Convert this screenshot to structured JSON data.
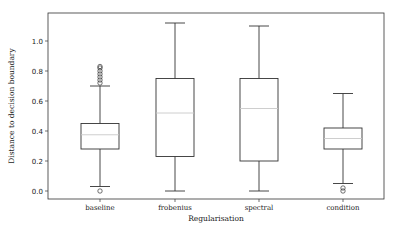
{
  "chart_data": {
    "type": "box",
    "title": "",
    "xlabel": "Regularisation",
    "ylabel": "Distance to decision boundary",
    "ylim": [
      -0.03,
      1.19
    ],
    "yticks": [
      0.0,
      0.2,
      0.4,
      0.6,
      0.8,
      1.0
    ],
    "ytick_labels": [
      "0.0",
      "0.2",
      "0.4",
      "0.6",
      "0.8",
      "1.0"
    ],
    "grid": false,
    "legend": null,
    "categories": [
      "baseline",
      "frobenius",
      "spectral",
      "condition"
    ],
    "series": [
      {
        "name": "baseline",
        "whisker_low": 0.03,
        "q1": 0.28,
        "median": 0.375,
        "q3": 0.45,
        "whisker_high": 0.7,
        "outliers": [
          0.0,
          0.72,
          0.74,
          0.76,
          0.78,
          0.8,
          0.82,
          0.83
        ]
      },
      {
        "name": "frobenius",
        "whisker_low": 0.0,
        "q1": 0.23,
        "median": 0.52,
        "q3": 0.75,
        "whisker_high": 1.12,
        "outliers": []
      },
      {
        "name": "spectral",
        "whisker_low": 0.0,
        "q1": 0.2,
        "median": 0.55,
        "q3": 0.75,
        "whisker_high": 1.1,
        "outliers": []
      },
      {
        "name": "condition",
        "whisker_low": 0.05,
        "q1": 0.28,
        "median": 0.35,
        "q3": 0.42,
        "whisker_high": 0.65,
        "outliers": [
          0.0,
          0.02
        ]
      }
    ],
    "colors": {
      "box": "#333333",
      "median": "#c8c8c8",
      "axis": "#333333"
    }
  }
}
